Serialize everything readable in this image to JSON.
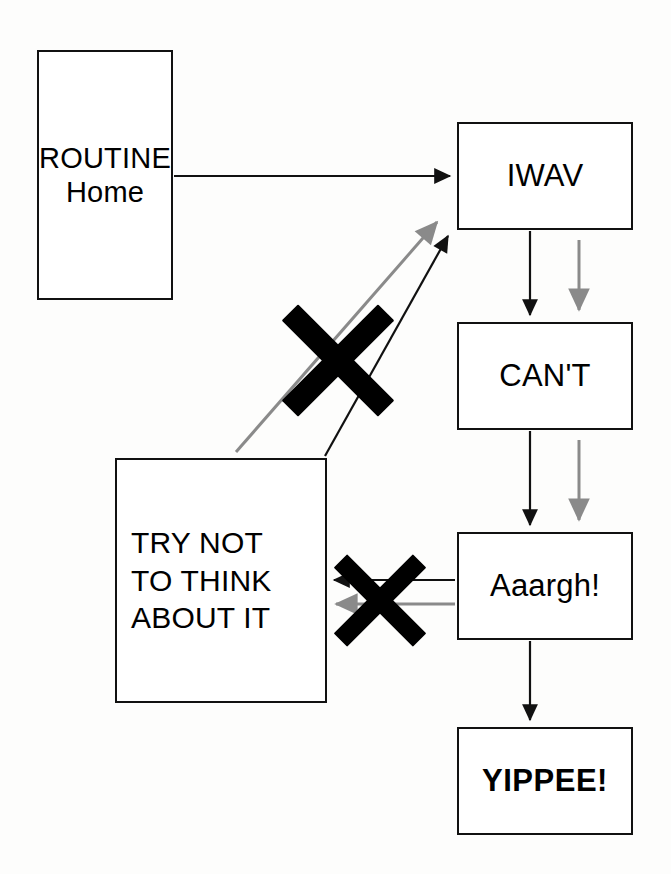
{
  "diagram": {
    "background_color": "#ffffff",
    "line_color": "#111111",
    "gray_line_color": "#8a8a8a",
    "nodes": [
      {
        "id": "routine",
        "label": "ROUTINE\nHome"
      },
      {
        "id": "iwav",
        "label": "IWAV"
      },
      {
        "id": "cant",
        "label": "CAN'T"
      },
      {
        "id": "aaargh",
        "label": "Aaargh!"
      },
      {
        "id": "yippee",
        "label": "YIPPEE!"
      },
      {
        "id": "trynot",
        "label": "TRY NOT\nTO THINK\nABOUT IT"
      }
    ],
    "edges": [
      {
        "id": "routine-to-iwav",
        "from": "routine",
        "to": "iwav",
        "color": "#111111",
        "style": "solid",
        "crossed_out": false
      },
      {
        "id": "iwav-to-cant",
        "from": "iwav",
        "to": "cant",
        "color": "#111111",
        "style": "solid",
        "crossed_out": false
      },
      {
        "id": "iwav-to-cant-gray",
        "from": "iwav",
        "to": "cant",
        "color": "#8a8a8a",
        "style": "solid",
        "crossed_out": false
      },
      {
        "id": "cant-to-aaargh",
        "from": "cant",
        "to": "aaargh",
        "color": "#111111",
        "style": "solid",
        "crossed_out": false
      },
      {
        "id": "cant-to-aaargh-gray",
        "from": "cant",
        "to": "aaargh",
        "color": "#8a8a8a",
        "style": "solid",
        "crossed_out": false
      },
      {
        "id": "aaargh-to-yippee",
        "from": "aaargh",
        "to": "yippee",
        "color": "#111111",
        "style": "solid",
        "crossed_out": false
      },
      {
        "id": "aaargh-to-trynot",
        "from": "aaargh",
        "to": "trynot",
        "color": "#111111",
        "style": "solid",
        "crossed_out": true
      },
      {
        "id": "aaargh-to-trynot-gray",
        "from": "aaargh",
        "to": "trynot",
        "color": "#8a8a8a",
        "style": "solid",
        "crossed_out": true
      },
      {
        "id": "trynot-to-iwav",
        "from": "trynot",
        "to": "iwav",
        "color": "#111111",
        "style": "solid",
        "crossed_out": true
      },
      {
        "id": "trynot-to-iwav-gray",
        "from": "trynot",
        "to": "iwav",
        "color": "#8a8a8a",
        "style": "solid",
        "crossed_out": true
      }
    ],
    "cross_marks": [
      {
        "id": "cross-top",
        "over_edge": "trynot-to-iwav",
        "color": "#000000"
      },
      {
        "id": "cross-bottom",
        "over_edge": "aaargh-to-trynot",
        "color": "#000000"
      }
    ]
  }
}
